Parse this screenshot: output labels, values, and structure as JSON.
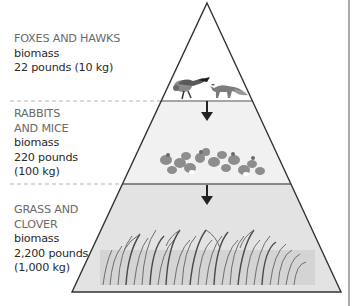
{
  "diagram": {
    "type": "ecological energy pyramid",
    "levels": [
      {
        "position": "top",
        "organisms": "FOXES AND HAWKS",
        "biomass_label": "biomass",
        "biomass_value": "22 pounds (10 kg)",
        "fill": "#ffffff",
        "illustration": "hawk-and-fox"
      },
      {
        "position": "middle",
        "organisms": "RABBITS\nAND MICE",
        "biomass_label": "biomass",
        "biomass_value": "220 pounds\n(100 kg)",
        "fill": "#f1f1f1",
        "illustration": "rabbits-and-mice"
      },
      {
        "position": "bottom",
        "organisms": "GRASS AND\nCLOVER",
        "biomass_label": "biomass",
        "biomass_value": "2,200 pounds\n(1,000 kg)",
        "fill": "#e3e3e3",
        "illustration": "grass-and-clover"
      }
    ],
    "arrows": [
      "down",
      "down"
    ],
    "colors": {
      "outline": "#333333",
      "divider": "#777777",
      "dashed_guide": "#b5b5b5",
      "arrow": "#222222"
    }
  }
}
